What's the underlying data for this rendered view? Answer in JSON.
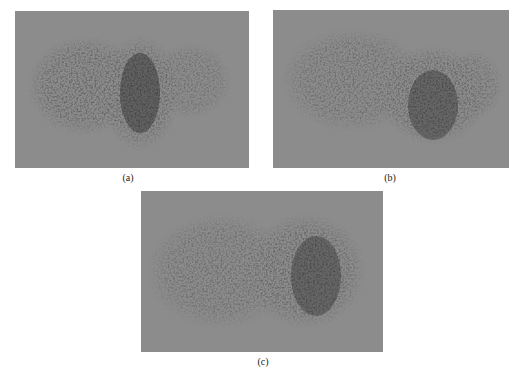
{
  "figure": {
    "panels": [
      {
        "id": "a",
        "caption": "(a)",
        "background": "#8c8c8c",
        "blob_color": "#2a2a2a"
      },
      {
        "id": "b",
        "caption": "(b)",
        "background": "#8c8c8c",
        "blob_color": "#2a2a2a"
      },
      {
        "id": "c",
        "caption": "(c)",
        "background": "#8c8c8c",
        "blob_color": "#2a2a2a"
      }
    ]
  }
}
